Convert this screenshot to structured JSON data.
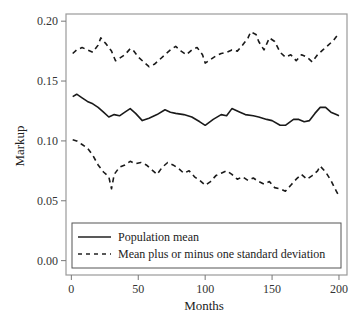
{
  "chart_data": {
    "type": "line",
    "title": "",
    "xlabel": "Months",
    "ylabel": "Markup",
    "xlim": [
      -4,
      206
    ],
    "ylim": [
      -0.012,
      0.206
    ],
    "xticks": [
      0,
      50,
      100,
      150,
      200
    ],
    "xtick_labels": [
      "0",
      "50",
      "100",
      "150",
      "200"
    ],
    "yticks": [
      0.0,
      0.05,
      0.1,
      0.15,
      0.2
    ],
    "ytick_labels": [
      "0.00",
      "0.05",
      "0.10",
      "0.15",
      "0.20"
    ],
    "grid": false,
    "legend_position": "bottom-inside",
    "series": [
      {
        "name": "Population mean",
        "style": "solid",
        "x": [
          1,
          4,
          8,
          12,
          16,
          20,
          24,
          28,
          32,
          36,
          40,
          44,
          48,
          53,
          58,
          64,
          70,
          74,
          78,
          84,
          90,
          96,
          100,
          106,
          112,
          116,
          120,
          126,
          130,
          136,
          140,
          146,
          150,
          156,
          160,
          166,
          170,
          174,
          178,
          182,
          186,
          190,
          194,
          198,
          200
        ],
        "y": [
          0.137,
          0.139,
          0.136,
          0.133,
          0.131,
          0.128,
          0.124,
          0.12,
          0.122,
          0.121,
          0.124,
          0.127,
          0.123,
          0.117,
          0.119,
          0.122,
          0.126,
          0.124,
          0.123,
          0.122,
          0.12,
          0.116,
          0.113,
          0.118,
          0.122,
          0.121,
          0.127,
          0.124,
          0.122,
          0.121,
          0.12,
          0.118,
          0.117,
          0.113,
          0.113,
          0.118,
          0.118,
          0.116,
          0.117,
          0.123,
          0.128,
          0.128,
          0.124,
          0.122,
          0.121
        ]
      },
      {
        "name": "Mean plus one standard deviation",
        "style": "dashed",
        "x": [
          1,
          4,
          8,
          12,
          16,
          20,
          22,
          26,
          30,
          33,
          36,
          40,
          44,
          46,
          50,
          54,
          58,
          62,
          66,
          70,
          74,
          78,
          82,
          86,
          90,
          94,
          98,
          100,
          104,
          108,
          112,
          116,
          120,
          124,
          128,
          132,
          134,
          138,
          140,
          144,
          148,
          152,
          156,
          160,
          164,
          168,
          172,
          176,
          180,
          184,
          188,
          192,
          196,
          200
        ],
        "y": [
          0.173,
          0.176,
          0.178,
          0.176,
          0.174,
          0.18,
          0.186,
          0.181,
          0.175,
          0.167,
          0.169,
          0.172,
          0.177,
          0.176,
          0.17,
          0.166,
          0.162,
          0.164,
          0.168,
          0.172,
          0.176,
          0.179,
          0.175,
          0.172,
          0.176,
          0.178,
          0.172,
          0.165,
          0.168,
          0.171,
          0.173,
          0.174,
          0.176,
          0.175,
          0.18,
          0.186,
          0.191,
          0.189,
          0.183,
          0.176,
          0.186,
          0.183,
          0.174,
          0.17,
          0.172,
          0.167,
          0.172,
          0.17,
          0.166,
          0.172,
          0.176,
          0.18,
          0.184,
          0.19
        ]
      },
      {
        "name": "Mean minus one standard deviation",
        "style": "dashed",
        "x": [
          1,
          4,
          8,
          12,
          16,
          20,
          24,
          28,
          30,
          32,
          36,
          40,
          44,
          48,
          52,
          56,
          60,
          64,
          68,
          72,
          76,
          80,
          84,
          88,
          92,
          96,
          100,
          104,
          108,
          112,
          116,
          120,
          124,
          128,
          132,
          136,
          140,
          144,
          148,
          152,
          156,
          160,
          164,
          168,
          172,
          176,
          180,
          184,
          186,
          190,
          194,
          198,
          200
        ],
        "y": [
          0.101,
          0.1,
          0.097,
          0.094,
          0.088,
          0.08,
          0.074,
          0.07,
          0.06,
          0.072,
          0.078,
          0.08,
          0.083,
          0.081,
          0.082,
          0.08,
          0.076,
          0.072,
          0.078,
          0.082,
          0.08,
          0.077,
          0.073,
          0.075,
          0.07,
          0.067,
          0.063,
          0.066,
          0.071,
          0.073,
          0.075,
          0.072,
          0.068,
          0.07,
          0.067,
          0.069,
          0.066,
          0.064,
          0.066,
          0.061,
          0.06,
          0.058,
          0.063,
          0.068,
          0.072,
          0.068,
          0.071,
          0.075,
          0.079,
          0.074,
          0.067,
          0.058,
          0.054
        ]
      }
    ],
    "legend": [
      {
        "label": "Population mean",
        "style": "solid"
      },
      {
        "label": "Mean plus or minus one standard deviation",
        "style": "dashed"
      }
    ]
  }
}
